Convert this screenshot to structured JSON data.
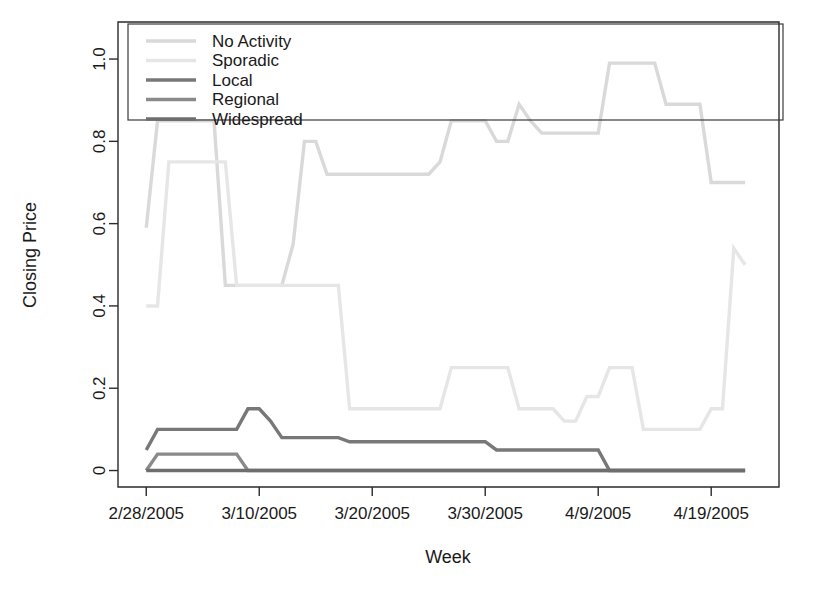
{
  "chart_data": {
    "type": "line",
    "title": "",
    "xlabel": "Week",
    "ylabel": "Closing Price",
    "grid": false,
    "legend_position": "top-left-inside",
    "xtick_labels": [
      "2/28/2005",
      "3/10/2005",
      "3/20/2005",
      "3/30/2005",
      "4/9/2005",
      "4/19/2005"
    ],
    "xtick_values": [
      0,
      10,
      20,
      30,
      40,
      50
    ],
    "ytick_labels": [
      "0",
      "0.2",
      "0.4",
      "0.6",
      "0.8",
      "1.0"
    ],
    "ytick_values": [
      0,
      0.2,
      0.4,
      0.6,
      0.8,
      1.0
    ],
    "xlim": [
      -2.5,
      56
    ],
    "ylim": [
      -0.04,
      1.09
    ],
    "x": [
      0,
      1,
      2,
      3,
      4,
      5,
      6,
      7,
      8,
      9,
      10,
      11,
      12,
      13,
      14,
      15,
      16,
      17,
      18,
      19,
      20,
      21,
      22,
      23,
      24,
      25,
      26,
      27,
      28,
      29,
      30,
      31,
      32,
      33,
      34,
      35,
      36,
      37,
      38,
      39,
      40,
      41,
      42,
      43,
      44,
      45,
      46,
      47,
      48,
      49,
      50,
      51,
      52,
      53
    ],
    "series": [
      {
        "name": "No Activity",
        "color": "#d9d9d9",
        "values": [
          0.59,
          0.85,
          0.85,
          0.85,
          0.85,
          0.85,
          0.85,
          0.45,
          0.45,
          0.45,
          0.45,
          0.45,
          0.45,
          0.55,
          0.8,
          0.8,
          0.72,
          0.72,
          0.72,
          0.72,
          0.72,
          0.72,
          0.72,
          0.72,
          0.72,
          0.72,
          0.75,
          0.85,
          0.85,
          0.85,
          0.85,
          0.8,
          0.8,
          0.89,
          0.85,
          0.82,
          0.82,
          0.82,
          0.82,
          0.82,
          0.82,
          0.99,
          0.99,
          0.99,
          0.99,
          0.99,
          0.89,
          0.89,
          0.89,
          0.89,
          0.7,
          0.7,
          0.7,
          0.7
        ]
      },
      {
        "name": "Sporadic",
        "color": "#e6e6e6",
        "values": [
          0.4,
          0.4,
          0.75,
          0.75,
          0.75,
          0.75,
          0.75,
          0.75,
          0.45,
          0.45,
          0.45,
          0.45,
          0.45,
          0.45,
          0.45,
          0.45,
          0.45,
          0.45,
          0.15,
          0.15,
          0.15,
          0.15,
          0.15,
          0.15,
          0.15,
          0.15,
          0.15,
          0.25,
          0.25,
          0.25,
          0.25,
          0.25,
          0.25,
          0.15,
          0.15,
          0.15,
          0.15,
          0.12,
          0.12,
          0.18,
          0.18,
          0.25,
          0.25,
          0.25,
          0.1,
          0.1,
          0.1,
          0.1,
          0.1,
          0.1,
          0.15,
          0.15,
          0.54,
          0.5
        ]
      },
      {
        "name": "Local",
        "color": "#787878",
        "values": [
          0.05,
          0.1,
          0.1,
          0.1,
          0.1,
          0.1,
          0.1,
          0.1,
          0.1,
          0.15,
          0.15,
          0.12,
          0.08,
          0.08,
          0.08,
          0.08,
          0.08,
          0.08,
          0.07,
          0.07,
          0.07,
          0.07,
          0.07,
          0.07,
          0.07,
          0.07,
          0.07,
          0.07,
          0.07,
          0.07,
          0.07,
          0.05,
          0.05,
          0.05,
          0.05,
          0.05,
          0.05,
          0.05,
          0.05,
          0.05,
          0.05,
          0.0,
          0.0,
          0.0,
          0.0,
          0.0,
          0.0,
          0.0,
          0.0,
          0.0,
          0.0,
          0.0,
          0.0,
          0.0
        ]
      },
      {
        "name": "Regional",
        "color": "#8a8a8a",
        "values": [
          0.0,
          0.04,
          0.04,
          0.04,
          0.04,
          0.04,
          0.04,
          0.04,
          0.04,
          0.0,
          0.0,
          0.0,
          0.0,
          0.0,
          0.0,
          0.0,
          0.0,
          0.0,
          0.0,
          0.0,
          0.0,
          0.0,
          0.0,
          0.0,
          0.0,
          0.0,
          0.0,
          0.0,
          0.0,
          0.0,
          0.0,
          0.0,
          0.0,
          0.0,
          0.0,
          0.0,
          0.0,
          0.0,
          0.0,
          0.0,
          0.0,
          0.0,
          0.0,
          0.0,
          0.0,
          0.0,
          0.0,
          0.0,
          0.0,
          0.0,
          0.0,
          0.0,
          0.0,
          0.0
        ]
      },
      {
        "name": "Widespread",
        "color": "#6e6e6e",
        "values": [
          0.0,
          0.0,
          0.0,
          0.0,
          0.0,
          0.0,
          0.0,
          0.0,
          0.0,
          0.0,
          0.0,
          0.0,
          0.0,
          0.0,
          0.0,
          0.0,
          0.0,
          0.0,
          0.0,
          0.0,
          0.0,
          0.0,
          0.0,
          0.0,
          0.0,
          0.0,
          0.0,
          0.0,
          0.0,
          0.0,
          0.0,
          0.0,
          0.0,
          0.0,
          0.0,
          0.0,
          0.0,
          0.0,
          0.0,
          0.0,
          0.0,
          0.0,
          0.0,
          0.0,
          0.0,
          0.0,
          0.0,
          0.0,
          0.0,
          0.0,
          0.0,
          0.0,
          0.0,
          0.0
        ]
      }
    ]
  },
  "legend": {
    "entries": [
      {
        "label": "No Activity",
        "color": "#d9d9d9"
      },
      {
        "label": "Sporadic",
        "color": "#e6e6e6"
      },
      {
        "label": "Local",
        "color": "#787878"
      },
      {
        "label": "Regional",
        "color": "#8a8a8a"
      },
      {
        "label": "Widespread",
        "color": "#6e6e6e"
      }
    ]
  },
  "axes": {
    "x_title": "Week",
    "y_title": "Closing Price"
  }
}
